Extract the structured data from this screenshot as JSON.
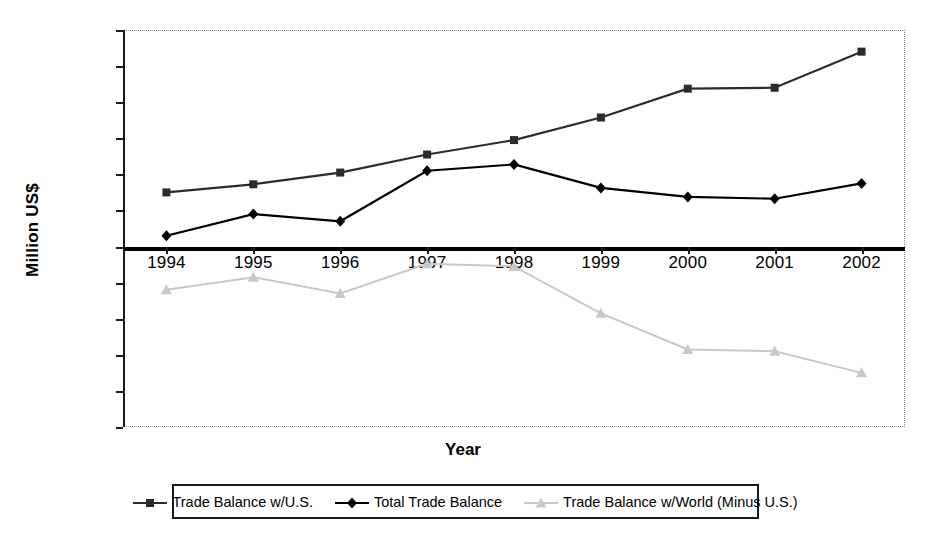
{
  "axes": {
    "ylabel": "Million US$",
    "xlabel": "Year",
    "yticks": [
      "120,000",
      "100,000",
      "80,000",
      "60,000",
      "40,000",
      "20,000",
      "0",
      "–20,000",
      "–40,000",
      "–60,000",
      "–80,000",
      "–100,000"
    ],
    "xticks": [
      "1994",
      "1995",
      "1996",
      "1997",
      "1998",
      "1999",
      "2000",
      "2001",
      "2002"
    ]
  },
  "legend": {
    "items": [
      {
        "label": "Trade Balance w/U.S.",
        "marker": "square",
        "color": "#2b2b2b"
      },
      {
        "label": "Total Trade Balance",
        "marker": "diamond",
        "color": "#000000"
      },
      {
        "label": "Trade Balance w/World (Minus U.S.)",
        "marker": "triangle",
        "color": "#c8c8c8"
      }
    ]
  },
  "chart_data": {
    "type": "line",
    "title": "",
    "xlabel": "Year",
    "ylabel": "Million US$",
    "ylim": [
      -100000,
      120000
    ],
    "ytick_step": 20000,
    "grid": false,
    "legend_position": "bottom",
    "categories": [
      "1994",
      "1995",
      "1996",
      "1997",
      "1998",
      "1999",
      "2000",
      "2001",
      "2002"
    ],
    "series": [
      {
        "name": "Trade Balance w/U.S.",
        "marker": "square",
        "color": "#2b2b2b",
        "values": [
          30000,
          34500,
          41000,
          51000,
          59000,
          71500,
          87500,
          88000,
          108000
        ]
      },
      {
        "name": "Total Trade Balance",
        "marker": "diamond",
        "color": "#000000",
        "values": [
          6000,
          18000,
          14000,
          42000,
          45500,
          32500,
          27500,
          26500,
          35000
        ]
      },
      {
        "name": "Trade Balance w/World (Minus U.S.)",
        "marker": "triangle",
        "color": "#c8c8c8",
        "values": [
          -24000,
          -17000,
          -26000,
          -9500,
          -11000,
          -37000,
          -57000,
          -58000,
          -70000
        ]
      }
    ]
  }
}
